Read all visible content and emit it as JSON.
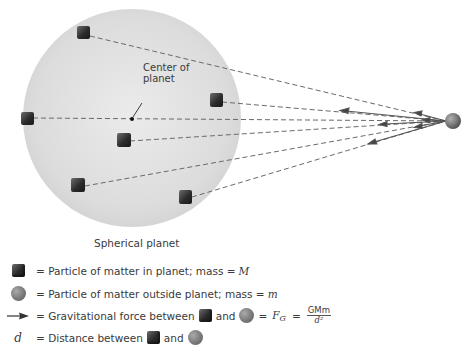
{
  "diagram": {
    "type": "gravitation-of-spherical-planet",
    "colors": {
      "planet_fill": "#d9d9d9",
      "planet_fill_center": "#e9e9e9",
      "cube": "#2b2b2b",
      "ball": "#808080",
      "line": "#6a6a6a",
      "text": "#3a3a3a"
    },
    "planet": {
      "cx": 132,
      "cy": 118,
      "r": 109
    },
    "center_point": {
      "x": 132,
      "y": 119
    },
    "outside_particle": {
      "x": 453,
      "y": 121,
      "r": 8
    },
    "cubes": [
      {
        "x": 83,
        "y": 33
      },
      {
        "x": 27,
        "y": 118
      },
      {
        "x": 216,
        "y": 100
      },
      {
        "x": 123,
        "y": 140
      },
      {
        "x": 78,
        "y": 185
      },
      {
        "x": 185,
        "y": 197
      }
    ],
    "arrows": [
      {
        "from_cube": 0,
        "arrow_x": 419,
        "arrow_y": 113
      },
      {
        "from_cube": 2,
        "arrow_x": 343,
        "arrow_y": 111
      },
      {
        "from_cube": 1,
        "arrow_x": 426,
        "arrow_y": 120
      },
      {
        "from_cube": 3,
        "arrow_x": 383,
        "arrow_y": 124
      },
      {
        "from_cube": 4,
        "arrow_x": 418,
        "arrow_y": 126
      },
      {
        "from_cube": 5,
        "arrow_x": 372,
        "arrow_y": 142
      }
    ],
    "labels": {
      "center_of_planet_line1": "Center of",
      "center_of_planet_line2": "planet",
      "planet_caption": "Spherical planet"
    }
  },
  "legend": {
    "items": [
      {
        "symbol": "cube",
        "text": "= Particle of matter in planet; mass = ",
        "var": "M"
      },
      {
        "symbol": "ball",
        "text": "= Particle of matter outside planet; mass = ",
        "var": "m"
      },
      {
        "symbol": "arrow",
        "text": "= Gravitational force between",
        "and": "and",
        "equals": "=",
        "force_symbol": "F",
        "force_sub": "G",
        "eq2": "=",
        "numerator": "GMm",
        "denominator": "d²"
      },
      {
        "symbol": "d",
        "symbol_text": "d",
        "text": "= Distance between",
        "and": "and"
      }
    ]
  }
}
